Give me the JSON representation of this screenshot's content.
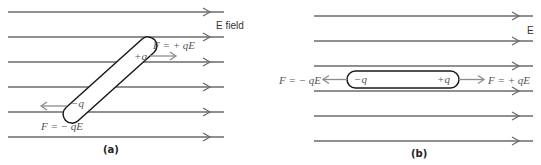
{
  "panel_a": {
    "caption": "(a)",
    "field_label": "E field",
    "field_lines_y": [
      12,
      37,
      62,
      87,
      112,
      137
    ],
    "positive_charge": "+q",
    "negative_charge": "−q",
    "force_positive": "F = + qE",
    "force_negative": "F = − qE",
    "dipole_orientation": "tilted"
  },
  "panel_b": {
    "caption": "(b)",
    "field_label": "E",
    "field_lines_y": [
      16,
      41,
      66,
      91,
      116,
      141
    ],
    "positive_charge": "+q",
    "negative_charge": "−q",
    "force_positive": "F = + qE",
    "force_negative": "F = − qE",
    "dipole_orientation": "aligned"
  },
  "colors": {
    "field_line": "#6b6b6b",
    "force_arrow": "#8c8c8c",
    "dipole_outline": "#1a1a1a"
  }
}
